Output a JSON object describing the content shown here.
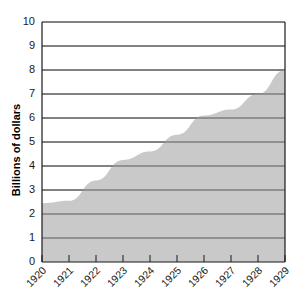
{
  "chart_data": {
    "type": "area",
    "title": "",
    "xlabel": "",
    "ylabel": "Billions of dollars",
    "categories": [
      "1920",
      "1921",
      "1922",
      "1923",
      "1924",
      "1925",
      "1926",
      "1927",
      "1928",
      "1929"
    ],
    "values": [
      2.45,
      2.55,
      3.4,
      4.25,
      4.6,
      5.3,
      6.1,
      6.35,
      7.0,
      8.0
    ],
    "x": [
      1920,
      1921,
      1922,
      1923,
      1924,
      1925,
      1926,
      1927,
      1928,
      1929
    ],
    "xlim": [
      1920,
      1929
    ],
    "ylim": [
      0,
      10
    ],
    "y_ticks": [
      "0",
      "1",
      "2",
      "3",
      "4",
      "5",
      "6",
      "7",
      "8",
      "9",
      "10"
    ],
    "y_tick_values": [
      0,
      1,
      2,
      3,
      4,
      5,
      6,
      7,
      8,
      9,
      10
    ],
    "grid": true,
    "grid_axis": "y",
    "legend": "none",
    "series": [
      {
        "name": "Billions of dollars",
        "values": [
          2.45,
          2.55,
          3.4,
          4.25,
          4.6,
          5.3,
          6.1,
          6.35,
          7.0,
          8.0
        ]
      }
    ],
    "colors": {
      "area_fill": "#c9c9c9",
      "grid_line": "#595959",
      "axis_line": "#1a1a1a",
      "background": "#ffffff",
      "text": "#1a1a1a"
    },
    "x_tick_rotation": -45
  }
}
